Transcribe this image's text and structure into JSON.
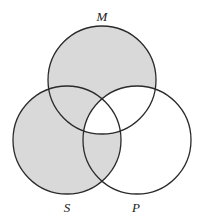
{
  "diagram": {
    "type": "venn-3-set",
    "shade_color": "#d9d9d9",
    "stroke_color": "#2a2a2a",
    "background": "#ffffff",
    "sets": [
      {
        "label": "M",
        "cx": 102,
        "cy": 80,
        "r": 54,
        "label_x": 102,
        "label_y": 21
      },
      {
        "label": "S",
        "cx": 67,
        "cy": 140,
        "r": 54,
        "label_x": 67,
        "label_y": 212
      },
      {
        "label": "P",
        "cx": 137,
        "cy": 140,
        "r": 54,
        "label_x": 136,
        "label_y": 212
      }
    ],
    "regions": {
      "M_only": "shaded",
      "S_only": "shaded",
      "P_only": "unshaded",
      "M_and_S_not_P": "shaded",
      "M_and_P_not_S": "unshaded",
      "S_and_P_not_M": "shaded",
      "M_and_S_and_P": "unshaded"
    }
  }
}
